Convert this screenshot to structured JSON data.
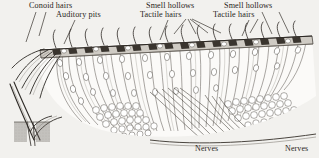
{
  "figure": {
    "kind": "anatomical-engraving",
    "background_color": "#f2f1ee",
    "ink_color": "#2f2b27",
    "width": 319,
    "height": 158
  },
  "labels": {
    "conoid_hairs": "Conoid hairs",
    "auditory_pits": "Auditory pits",
    "smell_hollows_left": "Smell hollows",
    "tactile_hairs_left": "Tactile hairs",
    "smell_hollows_right": "Smell hollows",
    "tactile_hairs_right": "Tactile hairs",
    "nerves_left": "Nerves",
    "nerves_right": "Nerves"
  }
}
